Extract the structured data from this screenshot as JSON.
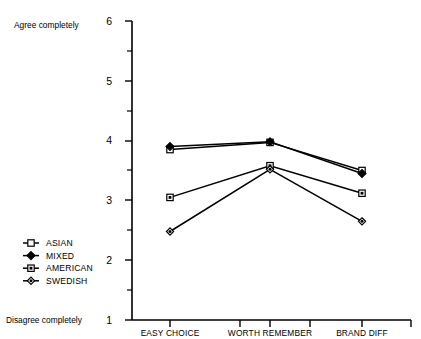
{
  "chart_data": {
    "type": "line",
    "title": "",
    "xlabel": "",
    "ylabel": "",
    "categories": [
      "EASY CHOICE",
      "WORTH REMEMBER",
      "BRAND DIFF"
    ],
    "ylim": [
      1,
      6
    ],
    "y_ticks": [
      "1",
      "2",
      "3",
      "4",
      "5",
      "6"
    ],
    "y_minor_ticks": [
      1.5,
      2.5,
      3.5,
      4.5,
      5.5
    ],
    "grid": false,
    "legend_position": "lower-left-outside",
    "axis_top_anchor": "Agree completely",
    "axis_bottom_anchor": "Disagree completely",
    "series": [
      {
        "name": "ASIAN",
        "marker": "open-square",
        "values": [
          3.85,
          3.97,
          3.5
        ]
      },
      {
        "name": "MIXED",
        "marker": "filled-diamond",
        "values": [
          3.9,
          3.98,
          3.45
        ]
      },
      {
        "name": "AMERICAN",
        "marker": "filled-square",
        "values": [
          3.05,
          3.58,
          3.12
        ]
      },
      {
        "name": "SWEDISH",
        "marker": "small-diamond",
        "values": [
          2.48,
          3.52,
          2.65
        ]
      }
    ],
    "colors": {
      "ink": "#000000",
      "background": "#ffffff"
    }
  },
  "legend": {
    "items": [
      {
        "label": "ASIAN",
        "marker": "open-square"
      },
      {
        "label": "MIXED",
        "marker": "filled-diamond"
      },
      {
        "label": "AMERICAN",
        "marker": "filled-square"
      },
      {
        "label": "SWEDISH",
        "marker": "small-diamond"
      }
    ]
  },
  "axis": {
    "top_anchor_label": "Agree completely",
    "bottom_anchor_label": "Disagree completely",
    "ytick_6": "6",
    "ytick_5": "5",
    "ytick_4": "4",
    "ytick_3": "3",
    "ytick_2": "2",
    "ytick_1": "1"
  },
  "categories": {
    "c0": "EASY CHOICE",
    "c1": "WORTH REMEMBER",
    "c2": "BRAND DIFF"
  }
}
